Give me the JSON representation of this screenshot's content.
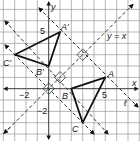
{
  "figure": {
    "type": "coordinate-plane reflection",
    "grid": {
      "xmin": -4,
      "xmax": 8,
      "ymin": -4,
      "ymax": 8,
      "unit_px": 11.33,
      "origin_px": [
        48.7,
        88.7
      ]
    },
    "axes": {
      "x_label": "x",
      "y_label": "y"
    },
    "tick_labels": [
      {
        "text": "5",
        "axis": "y",
        "value": 5
      },
      {
        "text": "−2",
        "axis": "x",
        "value": -2
      },
      {
        "text": "5",
        "axis": "x",
        "value": 5
      },
      {
        "text": "−2",
        "axis": "y",
        "value": -2
      }
    ],
    "line_of_reflection": {
      "label": "y = x",
      "equation": "y = x"
    },
    "line_l": {
      "label": "ℓ",
      "equation": "y = -x + 6"
    },
    "triangle_original": {
      "points": [
        {
          "name": "A",
          "x": 5,
          "y": 1
        },
        {
          "name": "B",
          "x": 2,
          "y": 0
        },
        {
          "name": "C",
          "x": 3,
          "y": -3
        }
      ]
    },
    "triangle_image": {
      "points": [
        {
          "name": "A'",
          "x": 1,
          "y": 5
        },
        {
          "name": "B'",
          "x": 0,
          "y": 2
        },
        {
          "name": "C'",
          "x": -3,
          "y": 3
        }
      ]
    },
    "perpendicular_lines": [
      "y = -x + 6",
      "y = -x + 2",
      "y = -x"
    ],
    "right_angle_markers": [
      [
        3,
        3
      ],
      [
        1,
        1
      ],
      [
        0,
        0
      ]
    ],
    "colors": {
      "grid": "#9a9a9a",
      "lines": "#111111"
    }
  },
  "labels": {
    "A": "A",
    "B": "B",
    "C": "C",
    "A_prime": "A′",
    "B_prime": "B′",
    "C_prime": "C′",
    "y_eq_x": "y = x",
    "ell": "ℓ",
    "x": "x",
    "y": "y",
    "tick_y5": "5",
    "tick_xneg2": "−2",
    "tick_x5": "5",
    "tick_yneg2": "−2"
  }
}
